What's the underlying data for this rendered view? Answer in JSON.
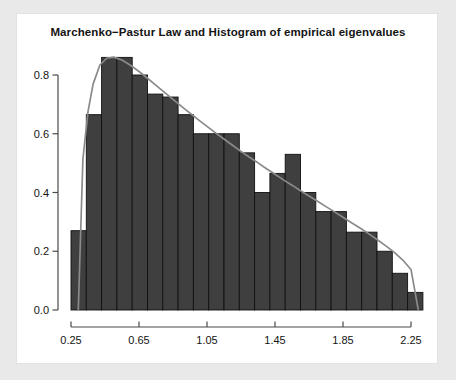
{
  "chart_data": {
    "type": "bar",
    "title": "Marchenko−Pastur Law and Histogram of empirical eigenvalues",
    "subtitle": "",
    "xlabel": "",
    "ylabel": "",
    "xlim": [
      0.2,
      2.33
    ],
    "ylim": [
      0.0,
      0.9
    ],
    "grid": false,
    "legend": null,
    "xticks": [
      "0.25",
      "0.65",
      "1.05",
      "1.45",
      "1.85",
      "2.25"
    ],
    "xtick_values": [
      0.25,
      0.65,
      1.05,
      1.45,
      1.85,
      2.25
    ],
    "yticks": [
      "0.0",
      "0.2",
      "0.4",
      "0.6",
      "0.8"
    ],
    "ytick_values": [
      0.0,
      0.2,
      0.4,
      0.6,
      0.8
    ],
    "bin_width": 0.09,
    "bin_starts": [
      0.25,
      0.34,
      0.43,
      0.52,
      0.61,
      0.7,
      0.79,
      0.88,
      0.97,
      1.06,
      1.15,
      1.24,
      1.33,
      1.42,
      1.51,
      1.6,
      1.69,
      1.78,
      1.87,
      1.96,
      2.05,
      2.14,
      2.23
    ],
    "values": [
      0.27,
      0.665,
      0.86,
      0.86,
      0.8,
      0.735,
      0.725,
      0.665,
      0.6,
      0.6,
      0.6,
      0.535,
      0.4,
      0.465,
      0.53,
      0.4,
      0.335,
      0.335,
      0.265,
      0.265,
      0.2,
      0.125,
      0.06
    ],
    "series": [
      {
        "name": "Histogram of empirical eigenvalues",
        "type": "bar",
        "color": "#3f3f3f",
        "edge_color": "#111111",
        "values": [
          0.27,
          0.665,
          0.86,
          0.86,
          0.8,
          0.735,
          0.725,
          0.665,
          0.6,
          0.6,
          0.6,
          0.535,
          0.4,
          0.465,
          0.53,
          0.4,
          0.335,
          0.335,
          0.265,
          0.265,
          0.2,
          0.125,
          0.06
        ]
      },
      {
        "name": "Marchenko-Pastur Law",
        "type": "line",
        "color": "#8a8a8a",
        "a": 0.2929,
        "b": 2.2929,
        "sigma2": 1.0,
        "lambda_ratio": 0.25,
        "x": [
          0.2929,
          0.32,
          0.35,
          0.38,
          0.42,
          0.46,
          0.5,
          0.55,
          0.6,
          0.65,
          0.7,
          0.75,
          0.8,
          0.85,
          0.9,
          0.95,
          1.0,
          1.05,
          1.1,
          1.15,
          1.2,
          1.25,
          1.3,
          1.35,
          1.4,
          1.45,
          1.5,
          1.55,
          1.6,
          1.65,
          1.7,
          1.75,
          1.8,
          1.85,
          1.9,
          1.95,
          2.0,
          2.05,
          2.1,
          2.15,
          2.2,
          2.25,
          2.2929
        ],
        "y": [
          0.0,
          0.513,
          0.675,
          0.769,
          0.834,
          0.857,
          0.861,
          0.851,
          0.833,
          0.812,
          0.789,
          0.765,
          0.741,
          0.717,
          0.693,
          0.67,
          0.647,
          0.625,
          0.603,
          0.582,
          0.561,
          0.54,
          0.52,
          0.501,
          0.481,
          0.462,
          0.443,
          0.425,
          0.406,
          0.388,
          0.37,
          0.352,
          0.334,
          0.316,
          0.297,
          0.279,
          0.26,
          0.24,
          0.219,
          0.197,
          0.171,
          0.138,
          0.0
        ]
      }
    ]
  },
  "figure": {
    "title": "Marchenko−Pastur Law and Histogram of empirical eigenvalues",
    "background": "#ffffff",
    "mat_color": "#e9e9ea",
    "axis_color": "#4a4a4a",
    "bar_fill": "#3f3f3f",
    "bar_edge": "#111111",
    "curve_color": "#8a8a8a"
  }
}
